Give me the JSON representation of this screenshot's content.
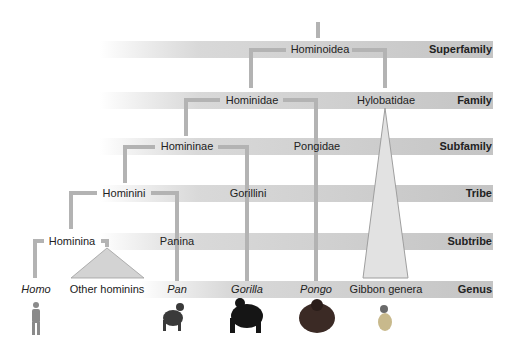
{
  "ranks": [
    {
      "label": "Superfamily",
      "y": 42
    },
    {
      "label": "Family",
      "y": 93
    },
    {
      "label": "Subfamily",
      "y": 139
    },
    {
      "label": "Tribe",
      "y": 186
    },
    {
      "label": "Subtribe",
      "y": 234
    },
    {
      "label": "Genus",
      "y": 282
    }
  ],
  "taxa": {
    "hominoidea": "Hominoidea",
    "hominidae": "Hominidae",
    "hylobatidae": "Hylobatidae",
    "homininae": "Homininae",
    "pongidae": "Pongidae",
    "hominini": "Hominini",
    "gorillini": "Gorillini",
    "hominina": "Hominina",
    "panina": "Panina",
    "homo": "Homo",
    "other_hominins": "Other hominins",
    "pan": "Pan",
    "gorilla": "Gorilla",
    "pongo": "Pongo",
    "gibbon_genera": "Gibbon genera"
  },
  "colors": {
    "band": "#c8c8c8",
    "branch": "#b3b3b3",
    "triangle": "#d6d6d6"
  }
}
